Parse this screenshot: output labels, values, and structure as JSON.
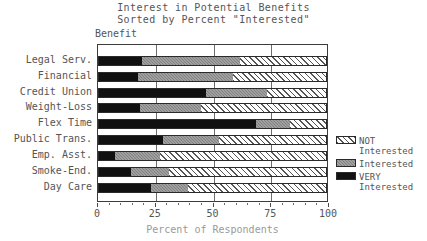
{
  "title": {
    "line1": "Interest in Potential Benefits",
    "line2": "Sorted by Percent \"Interested\""
  },
  "axis_label_top": "Benefit",
  "xtitle": "Percent of Respondents",
  "legend": {
    "position": "right",
    "items": [
      {
        "name": "not-interested",
        "label1": "NOT",
        "label2": "Interested",
        "color": "#ffffff",
        "pattern": "diagonal-hatch"
      },
      {
        "name": "interested",
        "label1": "Interested",
        "label2": "",
        "color": "#808080",
        "pattern": "checker"
      },
      {
        "name": "very-interested",
        "label1": "VERY",
        "label2": "Interested",
        "color": "#111111",
        "pattern": "solid"
      }
    ]
  },
  "chart_data": {
    "type": "bar",
    "orientation": "horizontal",
    "stacked": true,
    "xlabel": "Percent of Respondents",
    "ylabel": "Benefit",
    "xlim": [
      0,
      100
    ],
    "xticks": [
      0,
      25,
      50,
      75,
      100
    ],
    "xtick_labels": [
      "0",
      "25",
      "50",
      "75",
      "100"
    ],
    "grid": true,
    "categories": [
      "Legal Serv.",
      "Financial",
      "Credit Union",
      "Weight-Loss",
      "Flex Time",
      "Public Trans.",
      "Emp. Asst.",
      "Smoke-End.",
      "Day Care"
    ],
    "series": [
      {
        "name": "VERY Interested",
        "values": [
          19,
          17,
          47,
          18,
          69,
          28,
          7,
          14,
          23
        ]
      },
      {
        "name": "Interested",
        "values": [
          43,
          42,
          27,
          27,
          15,
          25,
          20,
          17,
          16
        ]
      },
      {
        "name": "NOT Interested",
        "values": [
          38,
          41,
          26,
          55,
          16,
          47,
          73,
          69,
          61
        ]
      }
    ]
  }
}
